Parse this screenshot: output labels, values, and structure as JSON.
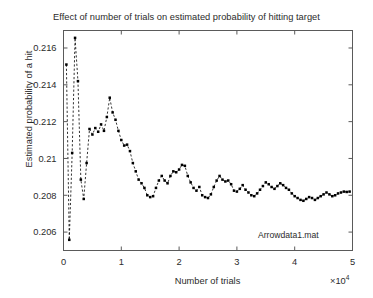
{
  "chart_data": {
    "type": "line",
    "title": "Effect of number of trials on estimated probability of hitting target",
    "xlabel": "Number of trials",
    "ylabel": "Estimated probability of a hit",
    "x_exponent_label": "×10",
    "x_exponent_power": "4",
    "annotation": "Arrowdata1.mat",
    "grid": false,
    "legend": "none",
    "marker": "filled-square",
    "linestyle": "dashed",
    "color": "#000000",
    "xlim": [
      0,
      50000
    ],
    "ylim": [
      0.205,
      0.21695
    ],
    "xticks": [
      0,
      10000,
      20000,
      30000,
      40000,
      50000
    ],
    "xticklabels": [
      "0",
      "1",
      "2",
      "3",
      "4",
      "5"
    ],
    "yticks": [
      0.206,
      0.208,
      0.21,
      0.212,
      0.214,
      0.216
    ],
    "yticklabels": [
      "0.206",
      "0.208",
      "0.21",
      "0.212",
      "0.214",
      "0.216"
    ],
    "x": [
      500,
      1000,
      1500,
      2000,
      2500,
      3000,
      3500,
      4000,
      4500,
      5000,
      5500,
      6000,
      6500,
      7000,
      7500,
      8000,
      8500,
      9000,
      9500,
      10000,
      10500,
      11000,
      11500,
      12000,
      12500,
      13000,
      13500,
      14000,
      14500,
      15000,
      15500,
      16000,
      16500,
      17000,
      17500,
      18000,
      18500,
      19000,
      19500,
      20000,
      20500,
      21000,
      21500,
      22000,
      22500,
      23000,
      23500,
      24000,
      24500,
      25000,
      25500,
      26000,
      26500,
      27000,
      27500,
      28000,
      28500,
      29000,
      29500,
      30000,
      30500,
      31000,
      31500,
      32000,
      32500,
      33000,
      33500,
      34000,
      34500,
      35000,
      35500,
      36000,
      36500,
      37000,
      37500,
      38000,
      38500,
      39000,
      39500,
      40000,
      40500,
      41000,
      41500,
      42000,
      42500,
      43000,
      43500,
      44000,
      44500,
      45000,
      45500,
      46000,
      46500,
      47000,
      47500,
      48000,
      48500,
      49000,
      49500,
      50000
    ],
    "y": [
      0.2151,
      0.20558,
      0.2103,
      0.21655,
      0.2142,
      0.20885,
      0.2078,
      0.20975,
      0.2116,
      0.2113,
      0.21165,
      0.21145,
      0.21185,
      0.2115,
      0.21225,
      0.2133,
      0.2125,
      0.2121,
      0.2115,
      0.211,
      0.2107,
      0.21075,
      0.2104,
      0.20975,
      0.2093,
      0.20885,
      0.20865,
      0.2084,
      0.208,
      0.2079,
      0.20795,
      0.2084,
      0.2088,
      0.20905,
      0.2088,
      0.20865,
      0.20905,
      0.2093,
      0.20925,
      0.2094,
      0.20965,
      0.2096,
      0.20905,
      0.2087,
      0.2084,
      0.20825,
      0.20845,
      0.208,
      0.2079,
      0.20785,
      0.20805,
      0.20845,
      0.2088,
      0.20905,
      0.20885,
      0.20875,
      0.2088,
      0.2086,
      0.20825,
      0.2082,
      0.20835,
      0.20855,
      0.2083,
      0.20815,
      0.208,
      0.20795,
      0.2081,
      0.2083,
      0.2085,
      0.2087,
      0.2086,
      0.20845,
      0.20835,
      0.2085,
      0.20865,
      0.20855,
      0.2084,
      0.2083,
      0.2081,
      0.20795,
      0.20785,
      0.20775,
      0.2077,
      0.2078,
      0.2079,
      0.20785,
      0.20775,
      0.20785,
      0.20795,
      0.20805,
      0.20815,
      0.20805,
      0.20795,
      0.208,
      0.2081,
      0.20815,
      0.2082,
      0.20818,
      0.2082
    ]
  }
}
